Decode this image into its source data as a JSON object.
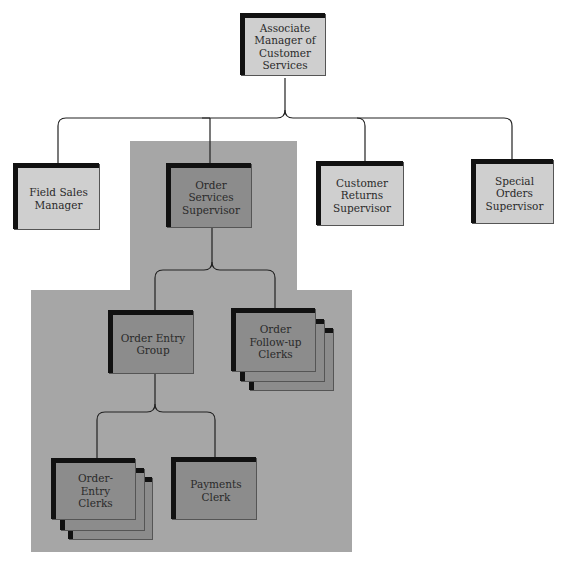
{
  "chart": {
    "title": "",
    "colors": {
      "background": "#ffffff",
      "highlight_region": "#a6a6a6",
      "box_light": "#cfcfcf",
      "box_dark": "#8c8c8c",
      "box_shadow": "#111111",
      "connector": "#222222"
    }
  },
  "nodes": {
    "root": {
      "label": "Associate Manager of Customer Services",
      "lines": [
        "Associate",
        "Manager of",
        "Customer",
        "Services"
      ]
    },
    "field_sales": {
      "label": "Field Sales Manager",
      "lines": [
        "Field Sales",
        "Manager"
      ]
    },
    "order_services": {
      "label": "Order Services Supervisor",
      "lines": [
        "Order Services",
        "Supervisor"
      ]
    },
    "customer_returns": {
      "label": "Customer Returns Supervisor",
      "lines": [
        "Customer",
        "Returns",
        "Supervisor"
      ]
    },
    "special_orders": {
      "label": "Special Orders Supervisor",
      "lines": [
        "Special",
        "Orders",
        "Supervisor"
      ]
    },
    "order_entry_group": {
      "label": "Order Entry Group",
      "lines": [
        "Order Entry",
        "Group"
      ]
    },
    "order_followup_clerks": {
      "label": "Order Follow-up Clerks",
      "lines": [
        "Order",
        "Follow-up",
        "Clerks"
      ]
    },
    "order_entry_clerks": {
      "label": "Order-Entry Clerks",
      "lines": [
        "Order-",
        "Entry",
        "Clerks"
      ]
    },
    "payments_clerk": {
      "label": "Payments Clerk",
      "lines": [
        "Payments",
        "Clerk"
      ]
    }
  },
  "edges": [
    [
      "root",
      "field_sales"
    ],
    [
      "root",
      "order_services"
    ],
    [
      "root",
      "customer_returns"
    ],
    [
      "root",
      "special_orders"
    ],
    [
      "order_services",
      "order_entry_group"
    ],
    [
      "order_services",
      "order_followup_clerks"
    ],
    [
      "order_entry_group",
      "order_entry_clerks"
    ],
    [
      "order_entry_group",
      "payments_clerk"
    ]
  ]
}
